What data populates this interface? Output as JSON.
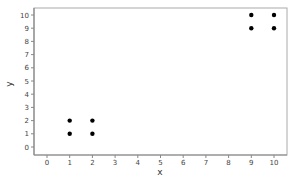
{
  "chart_data": {
    "type": "scatter",
    "title": "",
    "xlabel": "x",
    "ylabel": "y",
    "xlim": [
      -0.6,
      10.6
    ],
    "ylim": [
      -0.6,
      10.6
    ],
    "xticks": [
      0,
      1,
      2,
      3,
      4,
      5,
      6,
      7,
      8,
      9,
      10
    ],
    "yticks": [
      0,
      1,
      2,
      3,
      4,
      5,
      6,
      7,
      8,
      9,
      10
    ],
    "grid": false,
    "legend": null,
    "series": [
      {
        "name": "points",
        "color": "#000000",
        "points": [
          {
            "x": 1,
            "y": 1
          },
          {
            "x": 1,
            "y": 2
          },
          {
            "x": 2,
            "y": 1
          },
          {
            "x": 2,
            "y": 2
          },
          {
            "x": 9,
            "y": 9
          },
          {
            "x": 9,
            "y": 10
          },
          {
            "x": 10,
            "y": 9
          },
          {
            "x": 10,
            "y": 10
          }
        ]
      }
    ]
  },
  "colors": {
    "axis": "#888888",
    "frame": "#aaaaaa",
    "marker": "#000000"
  }
}
